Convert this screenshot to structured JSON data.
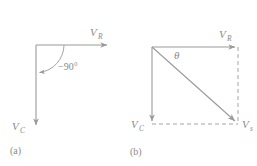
{
  "figure": {
    "type": "phasor-diagram",
    "stroke_color": "#9a9a9a",
    "text_color": "#8a8a8a",
    "background": "#ffffff"
  },
  "panel_a": {
    "caption": "(a)",
    "vectors": [
      {
        "name": "V_R",
        "symbol": "V",
        "subscript": "R",
        "direction": "right",
        "angle_deg": 0
      },
      {
        "name": "V_C",
        "symbol": "V",
        "subscript": "C",
        "direction": "down",
        "angle_deg": -90
      }
    ],
    "angle_label": "−90°",
    "arc": {
      "from_deg": 0,
      "to_deg": -90,
      "arrow_at": "end"
    }
  },
  "panel_b": {
    "caption": "(b)",
    "vectors": [
      {
        "name": "V_R",
        "symbol": "V",
        "subscript": "R",
        "direction": "right",
        "style": "solid"
      },
      {
        "name": "V_C",
        "symbol": "V",
        "subscript": "C",
        "direction": "down",
        "style": "solid"
      },
      {
        "name": "V_s",
        "symbol": "V",
        "subscript": "s",
        "direction": "diagonal-down-right",
        "style": "solid",
        "role": "resultant"
      }
    ],
    "angle_label": "θ",
    "construction_lines": [
      {
        "from": "V_R-tip",
        "to": "resultant-tip",
        "style": "dashed"
      },
      {
        "from": "V_C-tip",
        "to": "resultant-tip",
        "style": "dashed"
      }
    ]
  }
}
